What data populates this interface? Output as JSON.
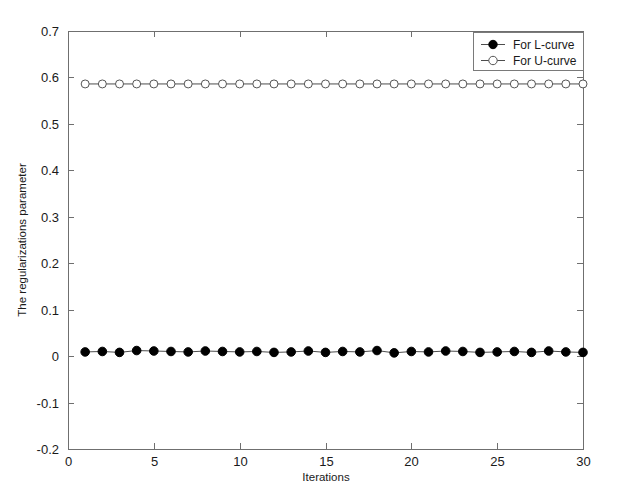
{
  "chart_data": {
    "type": "line",
    "title": "",
    "xlabel": "Iterations",
    "ylabel": "The regularizations parameter",
    "xlim": [
      0,
      30
    ],
    "ylim": [
      -0.2,
      0.7
    ],
    "xticks": [
      0,
      5,
      10,
      15,
      20,
      25,
      30
    ],
    "xticklabels": [
      "0",
      "5",
      "10",
      "15",
      "20",
      "25",
      "30"
    ],
    "yticks": [
      -0.2,
      -0.1,
      0,
      0.1,
      0.2,
      0.3,
      0.4,
      0.5,
      0.6,
      0.7
    ],
    "yticklabels": [
      "-0.2",
      "-0.1",
      "0",
      "0.1",
      "0.2",
      "0.3",
      "0.4",
      "0.5",
      "0.6",
      "0.7"
    ],
    "grid": false,
    "legend_position": "top-right",
    "x": [
      1,
      2,
      3,
      4,
      5,
      6,
      7,
      8,
      9,
      10,
      11,
      12,
      13,
      14,
      15,
      16,
      17,
      18,
      19,
      20,
      21,
      22,
      23,
      24,
      25,
      26,
      27,
      28,
      29,
      30
    ],
    "series": [
      {
        "name": "For L-curve",
        "marker": "filled-circle",
        "marker_color": "#000000",
        "line_color": "#4d4d4d",
        "values": [
          0.009,
          0.01,
          0.008,
          0.012,
          0.011,
          0.01,
          0.009,
          0.011,
          0.01,
          0.009,
          0.01,
          0.008,
          0.009,
          0.011,
          0.008,
          0.01,
          0.009,
          0.012,
          0.007,
          0.01,
          0.009,
          0.011,
          0.01,
          0.008,
          0.009,
          0.01,
          0.008,
          0.011,
          0.009,
          0.008
        ]
      },
      {
        "name": "For U-curve",
        "marker": "open-circle",
        "marker_color": "#555555",
        "line_color": "#4d4d4d",
        "values": [
          0.586,
          0.586,
          0.586,
          0.586,
          0.586,
          0.586,
          0.586,
          0.586,
          0.586,
          0.586,
          0.586,
          0.586,
          0.586,
          0.586,
          0.586,
          0.586,
          0.586,
          0.586,
          0.586,
          0.586,
          0.586,
          0.586,
          0.586,
          0.586,
          0.586,
          0.586,
          0.586,
          0.586,
          0.586,
          0.586
        ]
      }
    ]
  },
  "legend": {
    "entries": [
      {
        "label": "For L-curve"
      },
      {
        "label": "For U-curve"
      }
    ]
  },
  "colors": {
    "background": "#ffffff",
    "axis": "#6f6f6f",
    "text": "#1a1a1a",
    "l_curve": "#000000",
    "u_curve": "#555555"
  }
}
